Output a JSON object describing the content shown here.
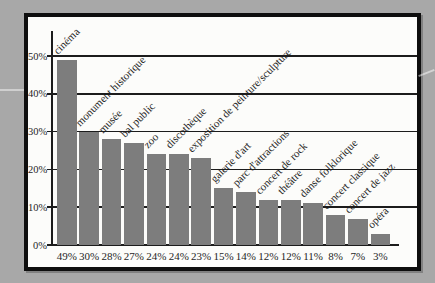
{
  "window": {
    "background_color": "#a8a8a8"
  },
  "chart_frame": {
    "background_color": "#fcfcfa",
    "border_color": "#0e0e0e"
  },
  "chart_data": {
    "type": "bar",
    "title": "",
    "xlabel": "",
    "ylabel": "",
    "categories": [
      "cinéma",
      "monument historique",
      "musée",
      "bal public",
      "zoo",
      "discothèque",
      "exposition de peinture/sculpture",
      "galerie d'art",
      "parc d'attractions",
      "concert de rock",
      "théâtre",
      "danse folklorique",
      "concert classique",
      "concert de jazz",
      "opéra"
    ],
    "values": [
      49,
      30,
      28,
      27,
      24,
      24,
      23,
      15,
      14,
      12,
      12,
      11,
      8,
      7,
      3
    ],
    "value_labels": [
      "49%",
      "30%",
      "28%",
      "27%",
      "24%",
      "24%",
      "23%",
      "15%",
      "14%",
      "12%",
      "12%",
      "11%",
      "8%",
      "7%",
      "3%"
    ],
    "y_ticks": [
      {
        "value": 0,
        "label": "0%"
      },
      {
        "value": 10,
        "label": "10%"
      },
      {
        "value": 20,
        "label": "20%"
      },
      {
        "value": 30,
        "label": "30%"
      },
      {
        "value": 40,
        "label": "40%"
      },
      {
        "value": 50,
        "label": "50%"
      }
    ],
    "ylim": [
      0,
      56
    ],
    "grid": true,
    "legend": "none",
    "bar_color": "#7d7d7d",
    "line_color": "#1c1c1c",
    "text_color": "#1f1f1f"
  }
}
